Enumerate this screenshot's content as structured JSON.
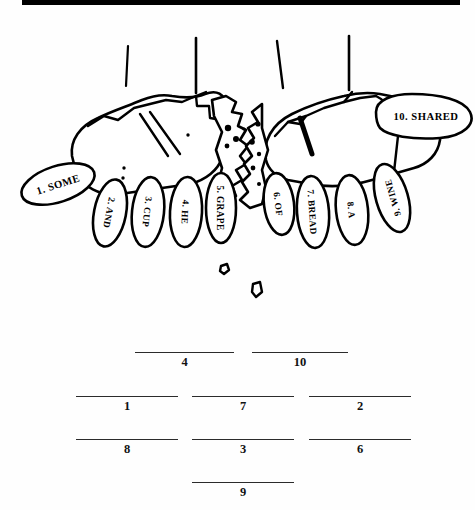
{
  "document": {
    "type": "worksheet-illustration",
    "title_rule_color": "#000000",
    "background_color": "#fefefe",
    "ink_color": "#000000"
  },
  "illustration": {
    "name": "two-hands-breaking-bread",
    "description": "Line drawing of two hands breaking a loaf of bread, with numbered word labels on each finger and thumb",
    "crumbs_count": 2
  },
  "finger_labels": [
    {
      "id": "label-1",
      "number": "1.",
      "word": "SOME",
      "text": "1. SOME",
      "hand": "left",
      "digit": "thumb"
    },
    {
      "id": "label-2",
      "number": "2.",
      "word": "AND",
      "text": "2. AND",
      "hand": "left",
      "digit": "little"
    },
    {
      "id": "label-3",
      "number": "3.",
      "word": "CUP",
      "text": "3. CUP",
      "hand": "left",
      "digit": "ring"
    },
    {
      "id": "label-4",
      "number": "4.",
      "word": "HE",
      "text": "4. HE",
      "hand": "left",
      "digit": "middle"
    },
    {
      "id": "label-5",
      "number": "5.",
      "word": "GRAPE",
      "text": "5. GRAPE",
      "hand": "left",
      "digit": "index"
    },
    {
      "id": "label-6",
      "number": "6.",
      "word": "OF",
      "text": "6. OF",
      "hand": "right",
      "digit": "index"
    },
    {
      "id": "label-7",
      "number": "7.",
      "word": "BREAD",
      "text": "7. BREAD",
      "hand": "right",
      "digit": "middle"
    },
    {
      "id": "label-8",
      "number": "8.",
      "word": "A",
      "text": "8. A",
      "hand": "right",
      "digit": "ring"
    },
    {
      "id": "label-9",
      "number": "9.",
      "word": "WINE",
      "text": "9. WINE",
      "hand": "right",
      "digit": "little"
    },
    {
      "id": "label-10",
      "number": "10.",
      "word": "SHARED",
      "text": "10. SHARED",
      "hand": "right",
      "digit": "thumb"
    }
  ],
  "answer_blanks": {
    "rows": [
      {
        "row": 1,
        "items": [
          {
            "number": "4"
          },
          {
            "number": "10"
          }
        ]
      },
      {
        "row": 2,
        "items": [
          {
            "number": "1"
          },
          {
            "number": "7"
          },
          {
            "number": "2"
          }
        ]
      },
      {
        "row": 3,
        "items": [
          {
            "number": "8"
          },
          {
            "number": "3"
          },
          {
            "number": "6"
          }
        ]
      },
      {
        "row": 4,
        "items": [
          {
            "number": "9"
          }
        ]
      }
    ],
    "total": 9
  }
}
